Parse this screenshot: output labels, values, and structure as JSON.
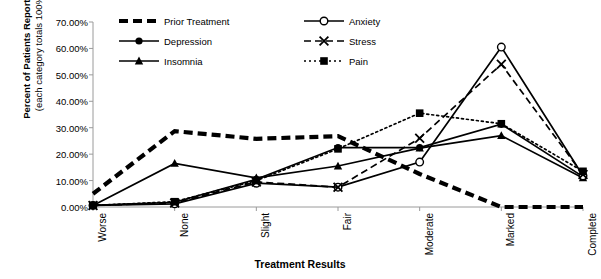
{
  "chart_data": {
    "type": "line",
    "title": "",
    "xlabel": "Treatment Results",
    "ylabel": "Percent of Patients Reporting",
    "ylabel_sub": "(each category totals 100%)",
    "categories": [
      "Worse",
      "None",
      "Slight",
      "Fair",
      "Moderate",
      "Marked",
      "Complete"
    ],
    "ylim": [
      0,
      70
    ],
    "ytick_labels": [
      "0.00%",
      "10.00%",
      "20.00%",
      "30.00%",
      "40.00%",
      "50.00%",
      "60.00%",
      "70.00%"
    ],
    "ytick_values": [
      0,
      10,
      20,
      30,
      40,
      50,
      60,
      70
    ],
    "grid": false,
    "legend_position": "top-center",
    "series": [
      {
        "name": "Prior Treatment",
        "style": "dashed",
        "marker": "none",
        "values": [
          5.0,
          28.7,
          25.8,
          26.8,
          12.5,
          0.0,
          0.0
        ]
      },
      {
        "name": "Depression",
        "style": "solid",
        "marker": "filled-circle",
        "values": [
          0.6,
          1.8,
          10.5,
          22.5,
          22.5,
          31.3,
          11.5
        ]
      },
      {
        "name": "Insomnia",
        "style": "solid",
        "marker": "filled-triangle",
        "values": [
          0.6,
          16.5,
          11.0,
          15.5,
          22.3,
          27.0,
          11.0
        ]
      },
      {
        "name": "Anxiety",
        "style": "solid",
        "marker": "open-circle",
        "values": [
          0.6,
          1.2,
          9.0,
          7.5,
          17.0,
          60.5,
          11.8
        ]
      },
      {
        "name": "Stress",
        "style": "dashed",
        "marker": "x",
        "values": [
          0.6,
          1.5,
          9.5,
          7.5,
          26.0,
          54.0,
          12.3
        ]
      },
      {
        "name": "Pain",
        "style": "dotted",
        "marker": "filled-square",
        "values": [
          0.6,
          2.0,
          10.0,
          22.0,
          35.5,
          31.5,
          13.5
        ]
      }
    ]
  },
  "legend": {
    "items": [
      {
        "label": "Prior Treatment"
      },
      {
        "label": "Depression"
      },
      {
        "label": "Insomnia"
      },
      {
        "label": "Anxiety"
      },
      {
        "label": "Stress"
      },
      {
        "label": "Pain"
      }
    ]
  }
}
